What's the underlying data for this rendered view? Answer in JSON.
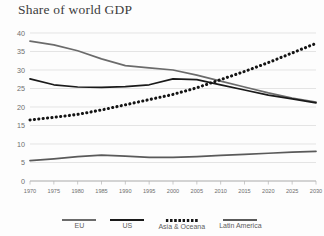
{
  "chart_data": {
    "type": "line",
    "title": "Share of world GDP",
    "xlabel": "",
    "ylabel": "",
    "xlim": [
      1970,
      2030
    ],
    "ylim": [
      0,
      40
    ],
    "grid": true,
    "legend_position": "bottom",
    "x": [
      1970,
      1975,
      1980,
      1985,
      1990,
      1995,
      2000,
      2005,
      2010,
      2015,
      2020,
      2025,
      2030
    ],
    "xticklabels": [
      "1970",
      "1975",
      "1980",
      "1985",
      "1990",
      "1995",
      "2000",
      "2005",
      "2010",
      "2015",
      "2020",
      "2025",
      "2030"
    ],
    "yticklabels": [
      "0",
      "5",
      "10",
      "15",
      "20",
      "25",
      "30",
      "35",
      "40"
    ],
    "yticks": [
      0,
      5,
      10,
      15,
      20,
      25,
      30,
      35,
      40
    ],
    "series": [
      {
        "name": "EU",
        "style": "solid",
        "color": "#6b6b6b",
        "values": [
          37.8,
          36.8,
          35.2,
          33.0,
          31.2,
          30.6,
          30.0,
          28.6,
          27.0,
          25.4,
          23.8,
          22.4,
          21.3
        ]
      },
      {
        "name": "US",
        "style": "solid",
        "color": "#1a1a1a",
        "values": [
          27.6,
          26.0,
          25.4,
          25.3,
          25.5,
          26.0,
          27.6,
          27.4,
          26.0,
          24.6,
          23.2,
          22.2,
          21.1
        ]
      },
      {
        "name": "Asia & Oceana",
        "style": "dotted",
        "color": "#141414",
        "values": [
          16.5,
          17.2,
          18.0,
          19.2,
          20.6,
          22.0,
          23.4,
          25.2,
          27.4,
          29.6,
          32.0,
          34.6,
          37.2
        ]
      },
      {
        "name": "Latin America",
        "style": "solid",
        "color": "#5a5a5a",
        "values": [
          5.5,
          6.0,
          6.6,
          7.0,
          6.7,
          6.4,
          6.4,
          6.6,
          6.9,
          7.2,
          7.5,
          7.8,
          8.0
        ]
      }
    ]
  },
  "legend": {
    "items": [
      {
        "label": "EU",
        "color": "#6b6b6b",
        "style": "solid"
      },
      {
        "label": "US",
        "color": "#1a1a1a",
        "style": "solid"
      },
      {
        "label": "Asia & Oceana",
        "color": "#141414",
        "style": "dotted"
      },
      {
        "label": "Latin America",
        "color": "#5a5a5a",
        "style": "solid"
      }
    ]
  }
}
